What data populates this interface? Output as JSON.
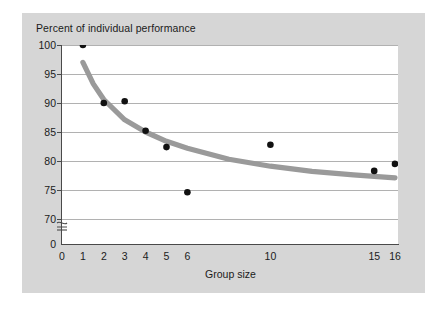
{
  "chart_data": {
    "type": "scatter",
    "title": "Percent of individual performance",
    "xlabel": "Group size",
    "ylabel": "",
    "x": [
      1,
      2,
      3,
      4,
      5,
      6,
      10,
      15,
      16
    ],
    "values": [
      100,
      90,
      90.3,
      85.2,
      82.4,
      74.6,
      82.8,
      78.3,
      79.5
    ],
    "points": [
      {
        "x": 1,
        "y": 100
      },
      {
        "x": 2,
        "y": 90
      },
      {
        "x": 3,
        "y": 90.3
      },
      {
        "x": 4,
        "y": 85.2
      },
      {
        "x": 5,
        "y": 82.4
      },
      {
        "x": 6,
        "y": 74.6
      },
      {
        "x": 10,
        "y": 82.8
      },
      {
        "x": 15,
        "y": 78.3
      },
      {
        "x": 16,
        "y": 79.5
      }
    ],
    "series": [
      {
        "name": "Observed performance",
        "type": "scatter",
        "values": [
          100,
          90,
          90.3,
          85.2,
          82.4,
          74.6,
          82.8,
          78.3,
          79.5
        ]
      },
      {
        "name": "Fitted trend curve",
        "type": "line",
        "x": [
          1,
          1.5,
          2,
          3,
          4,
          5,
          6,
          8,
          10,
          12,
          14,
          16
        ],
        "values": [
          97,
          93.3,
          90.6,
          87.1,
          85.0,
          83.4,
          82.2,
          80.3,
          79.1,
          78.2,
          77.6,
          77.1
        ]
      }
    ],
    "ylim": [
      70,
      100
    ],
    "yticks": [
      "100",
      "95",
      "90",
      "85",
      "80",
      "75",
      "70",
      "0"
    ],
    "ytick_values": [
      100,
      95,
      90,
      85,
      80,
      75,
      70,
      0
    ],
    "xticks": [
      "0",
      "1",
      "2",
      "3",
      "4",
      "5",
      "6",
      "10",
      "15",
      "16"
    ],
    "xtick_values": [
      0,
      1,
      2,
      3,
      4,
      5,
      6,
      10,
      15,
      16
    ],
    "axis_break": true,
    "axis_break_symbol": "~",
    "grid": "horizontal",
    "legend": "none",
    "colors": {
      "point": "#111111",
      "curve": "#9a9a9a",
      "grid": "#a8a8a8",
      "axis": "#4a4a4a",
      "panel": "#d6d6d6",
      "plot_background": "#ffffff",
      "text": "#1b1b1b"
    }
  }
}
